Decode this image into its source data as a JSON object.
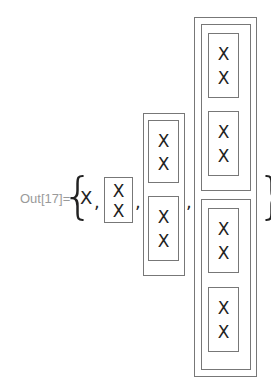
{
  "output": {
    "label": "Out[17]=",
    "open_brace": "{",
    "close_brace": "}",
    "separator": ",",
    "symbol": "X"
  },
  "structure": [
    {
      "level": 0,
      "content": "X"
    },
    {
      "level": 1,
      "content": [
        "X",
        "X"
      ]
    },
    {
      "level": 2,
      "content": [
        [
          "X",
          "X"
        ],
        [
          "X",
          "X"
        ]
      ]
    },
    {
      "level": 3,
      "content": [
        [
          [
            "X",
            "X"
          ],
          [
            "X",
            "X"
          ]
        ],
        [
          [
            "X",
            "X"
          ],
          [
            "X",
            "X"
          ]
        ]
      ]
    }
  ],
  "colors": {
    "frame": "#777777",
    "label": "#9a9a9a",
    "text": "#222222"
  }
}
